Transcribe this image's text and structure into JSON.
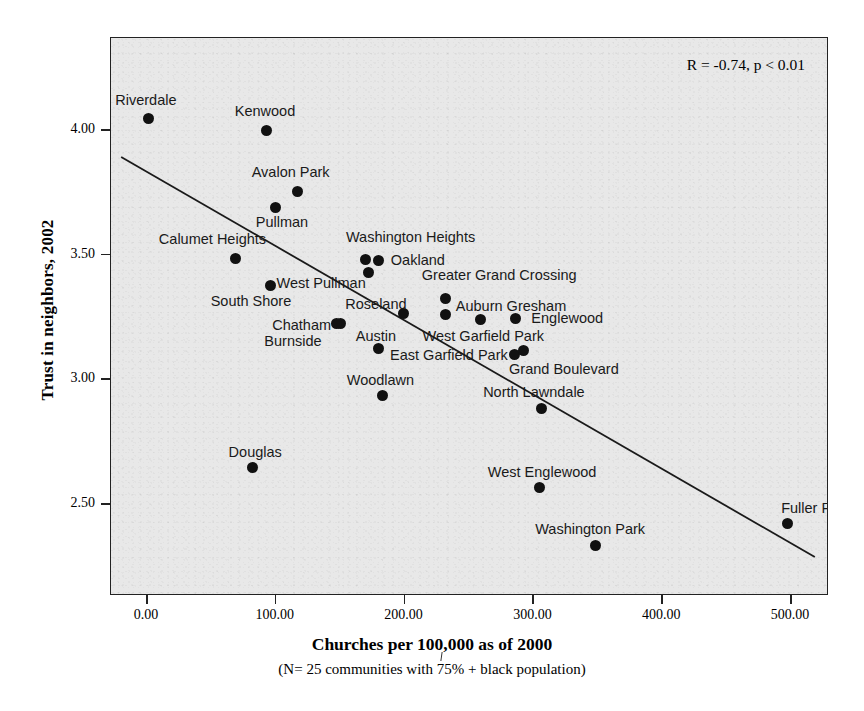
{
  "chart_data": {
    "type": "scatter",
    "title": "",
    "xlabel": "Churches per 100,000 as of 2000",
    "xsublabel": "(N= 25 communities with 75% + black population)",
    "ylabel": "Trust in neighbors, 2002",
    "xlim": [
      -20,
      520
    ],
    "ylim": [
      2.25,
      4.18
    ],
    "xticks": [
      "0.00",
      "100.00",
      "200.00",
      "300.00",
      "400.00",
      "500.00"
    ],
    "xtick_values": [
      0,
      100,
      200,
      300,
      400,
      500
    ],
    "yticks": [
      "4.00",
      "3.50",
      "3.00",
      "2.50"
    ],
    "ytick_values": [
      4.0,
      3.5,
      3.0,
      2.5
    ],
    "grid": false,
    "legend": "none",
    "annotation": "R = -0.74, p < 0.01",
    "correlation": -0.74,
    "p_value": "< 0.01",
    "trendline": {
      "type": "linear",
      "x_start": -20,
      "y_start": 3.89,
      "x_end": 520,
      "y_end": 2.28
    },
    "point_labels": [
      "Riverdale",
      "Kenwood",
      "Avalon Park",
      "Pullman",
      "Washington Heights",
      "Calumet Heights",
      "Oakland",
      "West Pullman",
      "South Shore",
      "Greater Grand Crossing",
      "Roseland",
      "Auburn Gresham",
      "Chatham",
      "Burnside",
      "Austin",
      "West Garfield Park",
      "Englewood",
      "East Garfield Park",
      "Grand Boulevard",
      "Woodlawn",
      "North Lawndale",
      "Douglas",
      "West Englewood",
      "Washington Park",
      "Fuller Park"
    ],
    "points": [
      {
        "name": "Riverdale",
        "x": 1,
        "y": 4.045,
        "label_dx": -33,
        "label_dy": -20
      },
      {
        "name": "Kenwood",
        "x": 93,
        "y": 4.0,
        "label_dx": -32,
        "label_dy": -20
      },
      {
        "name": "Avalon Park",
        "x": 117,
        "y": 3.755,
        "label_dx": -46,
        "label_dy": -20
      },
      {
        "name": "Pullman",
        "x": 100,
        "y": 3.69,
        "label_dx": -20,
        "label_dy": 14
      },
      {
        "name": "Washington Heights",
        "x": 170,
        "y": 3.48,
        "label_dx": -20,
        "label_dy": -24
      },
      {
        "name": "Calumet Heights",
        "x": 69,
        "y": 3.485,
        "label_dx": -77,
        "label_dy": -20
      },
      {
        "name": "Oakland",
        "x": 180,
        "y": 3.475,
        "label_dx": 12,
        "label_dy": -2
      },
      {
        "name": "West Pullman",
        "x": 172,
        "y": 3.43,
        "label_dx": -92,
        "label_dy": 10
      },
      {
        "name": "South Shore",
        "x": 96,
        "y": 3.375,
        "label_dx": -60,
        "label_dy": 14
      },
      {
        "name": "Greater Grand Crossing",
        "x": 232,
        "y": 3.325,
        "label_dx": -24,
        "label_dy": -24
      },
      {
        "name": "Roseland",
        "x": 199,
        "y": 3.265,
        "label_dx": -58,
        "label_dy": -10
      },
      {
        "name": "Auburn Gresham",
        "x": 232,
        "y": 3.26,
        "label_dx": 10,
        "label_dy": -10
      },
      {
        "name": "Chatham",
        "x": 150,
        "y": 3.225,
        "label_dx": -68,
        "label_dy": 1
      },
      {
        "name": "Burnside",
        "x": 147,
        "y": 3.225,
        "label_dx": -72,
        "label_dy": 17
      },
      {
        "name": "Austin",
        "x": 180,
        "y": 3.125,
        "label_dx": -23,
        "label_dy": -13
      },
      {
        "name": "West Garfield Park",
        "x": 259,
        "y": 3.24,
        "label_dx": -58,
        "label_dy": 16
      },
      {
        "name": "Englewood",
        "x": 286,
        "y": 3.245,
        "label_dx": 16,
        "label_dy": -1
      },
      {
        "name": "East Garfield Park",
        "x": 285,
        "y": 3.1,
        "label_dx": -124,
        "label_dy": 0
      },
      {
        "name": "Grand Boulevard",
        "x": 292,
        "y": 3.115,
        "label_dx": -14,
        "label_dy": 17
      },
      {
        "name": "Woodlawn",
        "x": 183,
        "y": 2.935,
        "label_dx": -36,
        "label_dy": -17
      },
      {
        "name": "North Lawndale",
        "x": 306,
        "y": 2.885,
        "label_dx": -58,
        "label_dy": -17
      },
      {
        "name": "Douglas",
        "x": 82,
        "y": 2.645,
        "label_dx": -24,
        "label_dy": -17
      },
      {
        "name": "West Englewood",
        "x": 305,
        "y": 2.565,
        "label_dx": -52,
        "label_dy": -17
      },
      {
        "name": "Washington Park",
        "x": 348,
        "y": 2.335,
        "label_dx": -60,
        "label_dy": -17
      },
      {
        "name": "Fuller Park",
        "x": 497,
        "y": 2.42,
        "label_dx": -6,
        "label_dy": -17
      }
    ]
  },
  "figure": {
    "background_color": "#ffffff",
    "plot_background_color": "#e8e8e8",
    "point_color": "#111111",
    "line_color": "#1a1a1a",
    "frame_color": "#222222"
  }
}
